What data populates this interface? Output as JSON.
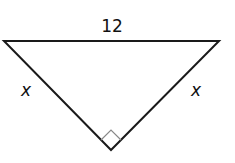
{
  "diagram": {
    "type": "right isosceles triangle",
    "hypotenuse_label": "12",
    "left_leg_label": "x",
    "right_leg_label": "x",
    "right_angle_marker": "right-angle-at-bottom-vertex",
    "colors": {
      "stroke": "#1a1a1a",
      "marker": "#888888",
      "background": "#ffffff"
    }
  }
}
